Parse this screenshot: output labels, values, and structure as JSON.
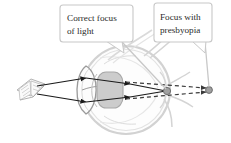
{
  "figure": {
    "background_color": "#ffffff"
  },
  "callouts": [
    {
      "id": "correct-focus",
      "line1": "Correct focus",
      "line2": "of light",
      "box": {
        "x": 60,
        "y": 5,
        "w": 73,
        "h": 37
      },
      "tail": "bottom-right",
      "border_color": "#c8c8c8",
      "fill_color": "#ffffff",
      "text_color": "#2b2b2b"
    },
    {
      "id": "presbyopia-focus",
      "line1": "Focus with",
      "line2": "presbyopia",
      "box": {
        "x": 154,
        "y": 3,
        "w": 58,
        "h": 39
      },
      "tail": "bottom-right",
      "border_color": "#c8c8c8",
      "fill_color": "#ffffff",
      "text_color": "#2b2b2b"
    }
  ],
  "anatomy": {
    "eyeball_label": "eyeball",
    "cornea_label": "cornea",
    "lens_label": "lens",
    "retina_label": "retina",
    "optic_nerve_label": "optic nerve",
    "object_label": "book",
    "outline_color": "#d2d2d2",
    "lens_fill_color": "#c9c9c9",
    "ray_color": "#1a1a1a",
    "focus_point_color": "#9a9a9a"
  },
  "focus_points": [
    {
      "id": "retina-focus-point",
      "x": 167,
      "y": 91,
      "r": 3.6
    },
    {
      "id": "presbyopia-focus-point",
      "x": 209,
      "y": 90,
      "r": 3.4
    }
  ]
}
